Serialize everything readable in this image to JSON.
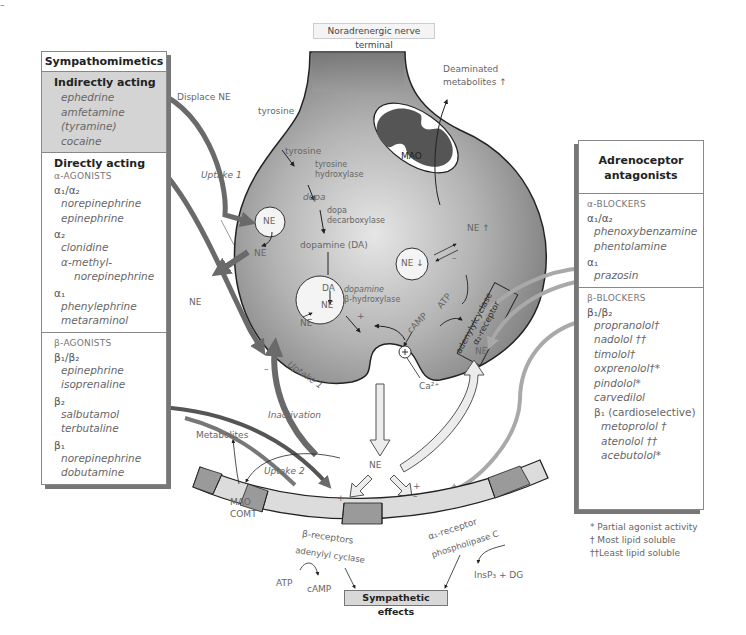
{
  "title": "Noradrenergic nerve terminal",
  "sympathomimetics": {
    "header": "Sympathomimetics",
    "indirect": {
      "title": "Indirectly acting",
      "drugs": [
        "ephedrine",
        "amfetamine",
        "(tyramine)",
        "cocaine"
      ]
    },
    "direct": {
      "title": "Directly acting",
      "alpha_category": "α-AGONISTS",
      "alpha12_label": "α₁/α₂",
      "alpha12_drugs": [
        "norepinephrine",
        "epinephrine"
      ],
      "alpha2_label": "α₂",
      "alpha2_drugs": [
        "clonidine",
        "α-methyl-",
        "norepinephrine"
      ],
      "alpha1_label": "α₁",
      "alpha1_drugs": [
        "phenylephrine",
        "metaraminol"
      ]
    },
    "beta": {
      "category": "β-AGONISTS",
      "beta12_label": "β₁/β₂",
      "beta12_drugs": [
        "epinephrine",
        "isoprenaline"
      ],
      "beta2_label": "β₂",
      "beta2_drugs": [
        "salbutamol",
        "terbutaline"
      ],
      "beta1_label": "β₁",
      "beta1_drugs": [
        "norepinephrine",
        "dobutamine"
      ]
    }
  },
  "antagonists": {
    "header_line1": "Adrenoceptor",
    "header_line2": "antagonists",
    "alpha": {
      "category": "α-BLOCKERS",
      "alpha12_label": "α₁/α₂",
      "alpha12_drugs": [
        "phenoxybenzamine",
        "phentolamine"
      ],
      "alpha1_label": "α₁",
      "alpha1_drugs": [
        "prazosin"
      ]
    },
    "beta": {
      "category": "β-BLOCKERS",
      "beta12_label": "β₁/β₂",
      "beta12_drugs": [
        "propranolol†",
        "nadolol ††",
        "timolol†",
        "oxprenolol†*",
        "pindolol*",
        "carvedilol"
      ],
      "beta1_label": "β₁ (cardioselective)",
      "beta1_drugs": [
        "metoprolol †",
        "atenolol ††",
        "acebutolol*"
      ]
    }
  },
  "legend": [
    "* Partial agonist activity",
    "† Most lipid soluble",
    "††Least lipid soluble"
  ],
  "labels": {
    "displace_ne": "Displace NE",
    "uptake1_top": "Uptake 1",
    "uptake1_bottom": "Uptake 1",
    "deaminated_1": "Deaminated",
    "deaminated_2": "metabolites ↑",
    "tyrosine_outside": "tyrosine",
    "tyrosine_inside": "tyrosine",
    "tyrosine_hydroxylase_1": "tyrosine",
    "tyrosine_hydroxylase_2": "hydroxylase",
    "dopa": "dopa",
    "dopa_decarboxylase_1": "dopa",
    "dopa_decarboxylase_2": "decarboxylase",
    "dopamine": "dopamine (DA)",
    "mao": "MAO",
    "ne_vesicle": "NE",
    "ne_out_vesicle": "NE",
    "ne_left": "NE",
    "ne_up": "NE ↑",
    "ne_down": "NE ↓",
    "da": "DA",
    "ne_dbh": "NE",
    "dbh_1": "dopamine",
    "dbh_2": "β-hydroxylase",
    "ne_release": "NE",
    "camp": "cAMP",
    "atp_top": "ATP",
    "adenylylcyclase": "adenylylcyclase",
    "alpha2_receptor": "α₂-receptor",
    "ca": "Ca²⁺",
    "ne_right": "NE",
    "inactivation": "Inactivation",
    "metabolites": "Metabolites",
    "uptake2": "Uptake 2",
    "ne_cleft": "NE",
    "mao_comt_1": "MAO",
    "mao_comt_2": "COMT",
    "beta_receptors": "β-receptors",
    "adenylyl_cyclase": "adenylyl cyclase",
    "alpha1_receptor": "α₁-receptor",
    "phospholipase": "phospholipase C",
    "atp_bottom": "ATP",
    "camp_bottom": "cAMP",
    "insp3": "InsP₃ + DG",
    "plus": "+",
    "minus": "–"
  },
  "effects": "Sympathetic effects",
  "colors": {
    "terminal": "#8a8a8a",
    "terminal_light": "#d9d9d9",
    "membrane_dark": "#9a9a9a",
    "membrane_light": "#dcdcdc",
    "arrow_dark": "#6e6e6e",
    "arrow_mid": "#a8a8a8"
  }
}
